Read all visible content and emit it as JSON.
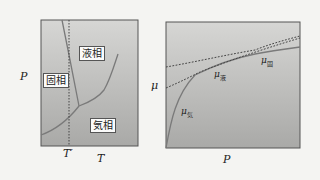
{
  "left_panel": {
    "y_axis_label": "P",
    "x_axis_label": "T",
    "marker_label": "T′",
    "phases": {
      "solid": "固相",
      "liquid": "液相",
      "gas": "気相"
    }
  },
  "right_panel": {
    "y_axis_label": "μ",
    "x_axis_label": "P",
    "curves": {
      "gas": {
        "symbol": "μ",
        "sub": "気"
      },
      "liquid": {
        "symbol": "μ",
        "sub": "液"
      },
      "solid": {
        "symbol": "μ",
        "sub": "固"
      }
    }
  },
  "colors": {
    "panel_top": "#d4d4d2",
    "panel_bottom": "#a8a8a6",
    "curve": "#7a7a7a",
    "dashed": "#444444",
    "border": "#555555"
  }
}
